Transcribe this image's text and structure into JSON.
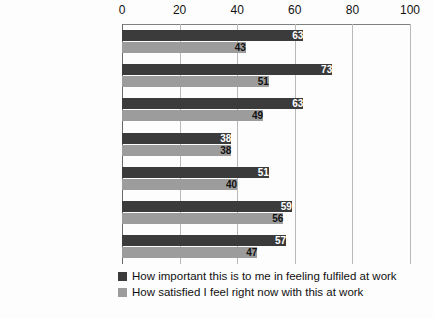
{
  "chart_data": {
    "type": "bar",
    "orientation": "horizontal",
    "title": "",
    "xlabel": "",
    "ylabel": "",
    "xlim": [
      0,
      100
    ],
    "xticks": [
      0,
      20,
      40,
      60,
      80,
      100
    ],
    "tick_labels": [
      "0",
      "20",
      "40",
      "60",
      "80",
      "100"
    ],
    "grid": true,
    "grid_axis": "x",
    "legend_position": "bottom-center",
    "categories": [
      "Promotion and\ncareer development",
      "Fair pay",
      "Flexible working",
      "Childcare provision",
      "Return to work and\nmaternity support",
      "Support from\nleadership and\nmanagement",
      "Network and\nmentor support"
    ],
    "series": [
      {
        "name": "How important this is to me in feeling fulfiled at work",
        "color": "#3b3b3b",
        "label_color": "#ffffff",
        "values": [
          63,
          73,
          63,
          38,
          51,
          59,
          57
        ]
      },
      {
        "name": "How satisfied I feel right now with this at work",
        "color": "#9c9c9c",
        "label_color": "#111111",
        "values": [
          43,
          51,
          49,
          38,
          40,
          56,
          47
        ]
      }
    ]
  },
  "legend": {
    "entries": [
      {
        "label": "How important this is to me in feeling fulfiled at work",
        "swatch": "important"
      },
      {
        "label": "How satisfied I feel right now with this at work",
        "swatch": "satisfied"
      }
    ]
  }
}
